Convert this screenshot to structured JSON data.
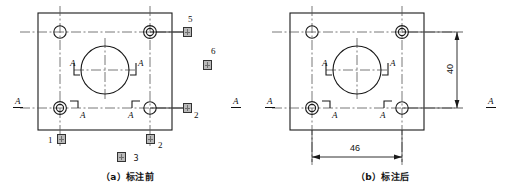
{
  "figure": {
    "number_prefix": "图",
    "number": "3",
    "panels": [
      {
        "id": "a",
        "caption": "（a）标注前",
        "caption_text": "标注前",
        "caption_key": "(a)",
        "plate": {
          "shape": "rectangle",
          "center_circle": true,
          "corner_holes": 4
        },
        "datum_labels": [
          "A",
          "A",
          "A",
          "A",
          "A",
          "A"
        ],
        "callouts": [
          {
            "id": "callout-5",
            "number": "5",
            "glyph": "tofu",
            "position": "top-right-outside"
          },
          {
            "id": "callout-6",
            "number": "6",
            "glyph": "tofu",
            "position": "right-middle-outside"
          },
          {
            "id": "callout-2-right",
            "number": "2",
            "glyph": "tofu",
            "position": "right-lower-outside"
          },
          {
            "id": "callout-1",
            "number": "1",
            "glyph": "tofu",
            "position": "bottom-left-outside"
          },
          {
            "id": "callout-2-bottom",
            "number": "2",
            "glyph": "tofu",
            "position": "bottom-right-outside"
          }
        ],
        "dimensions": []
      },
      {
        "id": "b",
        "caption": "（b）标注后",
        "caption_text": "标注后",
        "caption_key": "(b)",
        "plate": {
          "shape": "rectangle",
          "center_circle": true,
          "corner_holes": 4
        },
        "datum_labels": [
          "A",
          "A",
          "A",
          "A",
          "A",
          "A"
        ],
        "callouts": [],
        "dimensions": [
          {
            "id": "dim-vertical",
            "value": "40",
            "orientation": "vertical",
            "position": "right"
          },
          {
            "id": "dim-horizontal",
            "value": "46",
            "orientation": "horizontal",
            "position": "bottom"
          }
        ]
      }
    ]
  },
  "colors": {
    "line": "#1a1a1a",
    "centerline": "#555555",
    "background": "#ffffff",
    "tofu_fill": "#b9b9b9"
  }
}
